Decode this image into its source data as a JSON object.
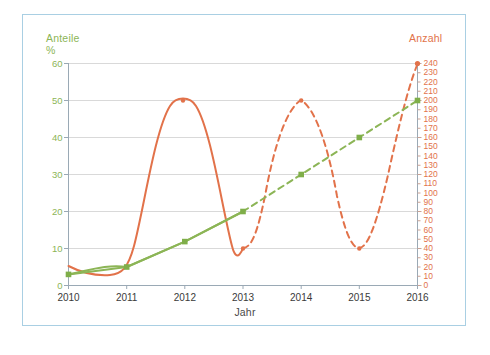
{
  "chart_data": {
    "type": "line",
    "title": "",
    "xlabel": "Jahr",
    "ylabel_left": "Anteile\n%",
    "ylabel_right": "Anzahl",
    "x": [
      2010,
      2011,
      2012,
      2013,
      2014,
      2015,
      2016
    ],
    "xlim": [
      2010,
      2016
    ],
    "xtick_labels": [
      "2010",
      "2011",
      "2012",
      "2013",
      "2014",
      "2015",
      "2016"
    ],
    "left_axis": {
      "label": "Anteile %",
      "color": "#8cb556",
      "lim": [
        0,
        60
      ],
      "ticks": [
        0,
        10,
        20,
        30,
        40,
        50,
        60
      ],
      "tick_labels": [
        "0",
        "10",
        "20",
        "30",
        "40",
        "50",
        "60"
      ]
    },
    "right_axis": {
      "label": "Anzahl",
      "color": "#e2724a",
      "lim": [
        0,
        240
      ],
      "ticks": [
        0,
        10,
        20,
        30,
        40,
        50,
        60,
        70,
        80,
        90,
        100,
        110,
        120,
        130,
        140,
        150,
        160,
        170,
        180,
        190,
        200,
        210,
        220,
        230,
        240
      ],
      "tick_labels": [
        "0",
        "10",
        "20",
        "30",
        "40",
        "50",
        "60",
        "70",
        "80",
        "90",
        "100",
        "110",
        "120",
        "130",
        "140",
        "150",
        "160",
        "170",
        "180",
        "190",
        "200",
        "210",
        "220",
        "230",
        "240"
      ],
      "major_ticks": [
        0,
        40,
        80,
        120,
        160,
        200,
        240
      ]
    },
    "grid": true,
    "legend": "none",
    "series": [
      {
        "name": "Anteile",
        "axis": "left",
        "color": "#8cb556",
        "marker": "square",
        "values": [
          3,
          5,
          12,
          20,
          30,
          40,
          50
        ],
        "solid_until": 2013,
        "dashed_from": 2013
      },
      {
        "name": "Anzahl",
        "axis": "right",
        "color": "#e2724a",
        "marker": "dot",
        "values": [
          20,
          18,
          192,
          40,
          200,
          100,
          240
        ],
        "solid_until": 2013,
        "dashed_from": 2013,
        "shape": "wave"
      }
    ]
  },
  "axes": {
    "left_title_line1": "Anteile",
    "left_title_line2": "%",
    "right_title": "Anzahl",
    "x_title": "Jahr"
  },
  "colors": {
    "border": "#a9cfe3",
    "grid": "#d8d8d8",
    "axis": "#9aa9b5",
    "green": "#8cb556",
    "orange": "#e2724a",
    "text": "#3a3a3a"
  }
}
